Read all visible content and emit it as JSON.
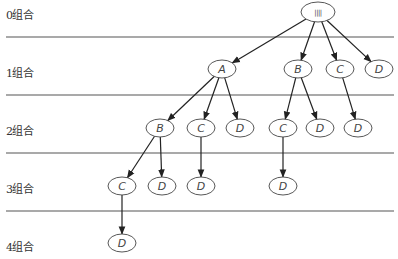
{
  "levels": [
    {
      "label": "0组合"
    },
    {
      "label": "1组合"
    },
    {
      "label": "2组合"
    },
    {
      "label": "3组合"
    },
    {
      "label": "4组合"
    }
  ],
  "nodes": [
    {
      "id": "root",
      "label": "||||",
      "level": 0
    },
    {
      "id": "A",
      "label": "A",
      "level": 1
    },
    {
      "id": "B1",
      "label": "B",
      "level": 1
    },
    {
      "id": "C1",
      "label": "C",
      "level": 1
    },
    {
      "id": "D1",
      "label": "D",
      "level": 1
    },
    {
      "id": "AB",
      "label": "B",
      "level": 2
    },
    {
      "id": "AC",
      "label": "C",
      "level": 2
    },
    {
      "id": "AD",
      "label": "D",
      "level": 2
    },
    {
      "id": "BC",
      "label": "C",
      "level": 2
    },
    {
      "id": "BD",
      "label": "D",
      "level": 2
    },
    {
      "id": "CD",
      "label": "D",
      "level": 2
    },
    {
      "id": "ABC",
      "label": "C",
      "level": 3
    },
    {
      "id": "ABD",
      "label": "D",
      "level": 3
    },
    {
      "id": "ACD",
      "label": "D",
      "level": 3
    },
    {
      "id": "BCD",
      "label": "D",
      "level": 3
    },
    {
      "id": "ABCD",
      "label": "D",
      "level": 4
    }
  ],
  "edges": [
    [
      "root",
      "A"
    ],
    [
      "root",
      "B1"
    ],
    [
      "root",
      "C1"
    ],
    [
      "root",
      "D1"
    ],
    [
      "A",
      "AB"
    ],
    [
      "A",
      "AC"
    ],
    [
      "A",
      "AD"
    ],
    [
      "B1",
      "BC"
    ],
    [
      "B1",
      "BD"
    ],
    [
      "C1",
      "CD"
    ],
    [
      "AB",
      "ABC"
    ],
    [
      "AB",
      "ABD"
    ],
    [
      "AC",
      "ACD"
    ],
    [
      "BC",
      "BCD"
    ],
    [
      "ABC",
      "ABCD"
    ]
  ]
}
